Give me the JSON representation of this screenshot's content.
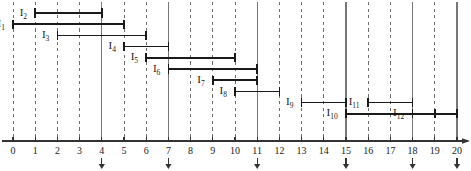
{
  "figure": {
    "title_partial": "",
    "axis": {
      "min": 0,
      "max": 20,
      "tick_step": 1,
      "tick_labels": [
        "0",
        "1",
        "2",
        "3",
        "4",
        "5",
        "6",
        "7",
        "8",
        "9",
        "10",
        "11",
        "12",
        "13",
        "14",
        "15",
        "16",
        "17",
        "18",
        "19",
        "20"
      ]
    },
    "solid_lines_with_arrows": [
      4,
      7,
      11,
      15,
      18,
      20
    ],
    "dashed_lines": [
      0,
      1,
      2,
      3,
      5,
      6,
      8,
      9,
      10,
      12,
      13,
      14,
      16,
      17,
      19
    ],
    "colors": {
      "ink": "#1a1a1a",
      "grid_dashed": "#6e6e6e",
      "grid_solid": "#777777",
      "axis": "#333333"
    }
  },
  "chart_data": {
    "type": "bar",
    "xlabel": "",
    "ylabel": "",
    "xlim": [
      0,
      20
    ],
    "grid": true,
    "legend": "none",
    "orientation": "horizontal-ranges",
    "categories": [
      "I1",
      "I2",
      "I3",
      "I4",
      "I5",
      "I6",
      "I7",
      "I8",
      "I9",
      "I10",
      "I11",
      "I12"
    ],
    "intervals": [
      {
        "name": "I1",
        "label": "I",
        "sub": "1",
        "start": 0,
        "end": 5,
        "row": 1,
        "label_side": "left"
      },
      {
        "name": "I2",
        "label": "I",
        "sub": "2",
        "start": 1,
        "end": 4,
        "row": 0,
        "label_side": "left"
      },
      {
        "name": "I3",
        "label": "I",
        "sub": "3",
        "start": 2,
        "end": 6,
        "row": 2,
        "label_side": "left"
      },
      {
        "name": "I4",
        "label": "I",
        "sub": "4",
        "start": 5,
        "end": 7,
        "row": 3,
        "label_side": "left"
      },
      {
        "name": "I5",
        "label": "I",
        "sub": "5",
        "start": 6,
        "end": 10,
        "row": 4,
        "label_side": "left"
      },
      {
        "name": "I6",
        "label": "I",
        "sub": "6",
        "start": 7,
        "end": 11,
        "row": 5,
        "label_side": "left"
      },
      {
        "name": "I7",
        "label": "I",
        "sub": "7",
        "start": 9,
        "end": 11,
        "row": 6,
        "label_side": "left"
      },
      {
        "name": "I8",
        "label": "I",
        "sub": "8",
        "start": 10,
        "end": 12,
        "row": 7,
        "label_side": "left"
      },
      {
        "name": "I9",
        "label": "I",
        "sub": "9",
        "start": 13,
        "end": 15,
        "row": 8,
        "label_side": "left"
      },
      {
        "name": "I10",
        "label": "I",
        "sub": "10",
        "start": 15,
        "end": 19,
        "row": 9,
        "label_side": "left"
      },
      {
        "name": "I11",
        "label": "I",
        "sub": "11",
        "start": 16,
        "end": 18,
        "row": 8,
        "label_side": "left"
      },
      {
        "name": "I12",
        "label": "I",
        "sub": "12",
        "start": 18,
        "end": 20,
        "row": 9,
        "label_side": "left"
      }
    ]
  }
}
